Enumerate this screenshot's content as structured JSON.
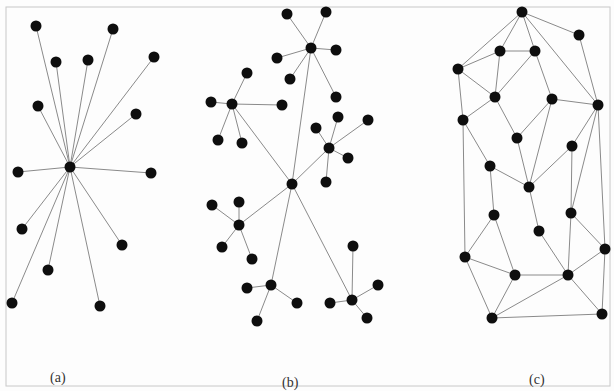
{
  "panels": [
    {
      "id": "a",
      "label": "(a)",
      "type": "star",
      "nodes": [
        {
          "id": "c",
          "x": 70,
          "y": 167
        },
        {
          "id": "n1",
          "x": 36,
          "y": 26
        },
        {
          "id": "n2",
          "x": 113,
          "y": 29
        },
        {
          "id": "n3",
          "x": 56,
          "y": 62
        },
        {
          "id": "n4",
          "x": 88,
          "y": 60
        },
        {
          "id": "n5",
          "x": 154,
          "y": 57
        },
        {
          "id": "n6",
          "x": 38,
          "y": 106
        },
        {
          "id": "n7",
          "x": 136,
          "y": 114
        },
        {
          "id": "n8",
          "x": 18,
          "y": 172
        },
        {
          "id": "n9",
          "x": 151,
          "y": 173
        },
        {
          "id": "n10",
          "x": 22,
          "y": 229
        },
        {
          "id": "n11",
          "x": 122,
          "y": 245
        },
        {
          "id": "n12",
          "x": 48,
          "y": 270
        },
        {
          "id": "n13",
          "x": 12,
          "y": 303
        },
        {
          "id": "n14",
          "x": 100,
          "y": 306
        }
      ],
      "edges": [
        [
          "c",
          "n1"
        ],
        [
          "c",
          "n2"
        ],
        [
          "c",
          "n3"
        ],
        [
          "c",
          "n4"
        ],
        [
          "c",
          "n5"
        ],
        [
          "c",
          "n6"
        ],
        [
          "c",
          "n7"
        ],
        [
          "c",
          "n8"
        ],
        [
          "c",
          "n9"
        ],
        [
          "c",
          "n10"
        ],
        [
          "c",
          "n11"
        ],
        [
          "c",
          "n12"
        ],
        [
          "c",
          "n13"
        ],
        [
          "c",
          "n14"
        ]
      ]
    },
    {
      "id": "b",
      "label": "(b)",
      "type": "hierarchical",
      "nodes": [
        {
          "id": "c",
          "x": 292,
          "y": 184
        },
        {
          "id": "h1",
          "x": 311,
          "y": 48
        },
        {
          "id": "h1a",
          "x": 287,
          "y": 14
        },
        {
          "id": "h1b",
          "x": 326,
          "y": 12
        },
        {
          "id": "h1c",
          "x": 277,
          "y": 58
        },
        {
          "id": "h1d",
          "x": 336,
          "y": 50
        },
        {
          "id": "h1e",
          "x": 290,
          "y": 79
        },
        {
          "id": "h1f",
          "x": 336,
          "y": 97
        },
        {
          "id": "h2",
          "x": 232,
          "y": 104
        },
        {
          "id": "h2a",
          "x": 211,
          "y": 102
        },
        {
          "id": "h2b",
          "x": 247,
          "y": 73
        },
        {
          "id": "h2c",
          "x": 282,
          "y": 105
        },
        {
          "id": "h2d",
          "x": 218,
          "y": 140
        },
        {
          "id": "h2e",
          "x": 242,
          "y": 143
        },
        {
          "id": "h3",
          "x": 329,
          "y": 148
        },
        {
          "id": "h3a",
          "x": 316,
          "y": 128
        },
        {
          "id": "h3b",
          "x": 338,
          "y": 117
        },
        {
          "id": "h3c",
          "x": 368,
          "y": 120
        },
        {
          "id": "h3d",
          "x": 348,
          "y": 158
        },
        {
          "id": "h3e",
          "x": 326,
          "y": 182
        },
        {
          "id": "h4",
          "x": 239,
          "y": 225
        },
        {
          "id": "h4a",
          "x": 212,
          "y": 205
        },
        {
          "id": "h4b",
          "x": 239,
          "y": 202
        },
        {
          "id": "h4c",
          "x": 222,
          "y": 247
        },
        {
          "id": "h4d",
          "x": 252,
          "y": 259
        },
        {
          "id": "h5",
          "x": 271,
          "y": 285
        },
        {
          "id": "h5a",
          "x": 247,
          "y": 288
        },
        {
          "id": "h5b",
          "x": 297,
          "y": 303
        },
        {
          "id": "h5c",
          "x": 257,
          "y": 321
        },
        {
          "id": "h6",
          "x": 352,
          "y": 300
        },
        {
          "id": "h6a",
          "x": 353,
          "y": 246
        },
        {
          "id": "h6b",
          "x": 378,
          "y": 285
        },
        {
          "id": "h6c",
          "x": 330,
          "y": 303
        },
        {
          "id": "h6d",
          "x": 367,
          "y": 318
        }
      ],
      "edges": [
        [
          "c",
          "h1"
        ],
        [
          "c",
          "h2"
        ],
        [
          "c",
          "h3"
        ],
        [
          "c",
          "h4"
        ],
        [
          "c",
          "h5"
        ],
        [
          "c",
          "h6"
        ],
        [
          "h1",
          "h1a"
        ],
        [
          "h1",
          "h1b"
        ],
        [
          "h1",
          "h1c"
        ],
        [
          "h1",
          "h1d"
        ],
        [
          "h1",
          "h1e"
        ],
        [
          "h1",
          "h1f"
        ],
        [
          "h2",
          "h2a"
        ],
        [
          "h2",
          "h2b"
        ],
        [
          "h2",
          "h2c"
        ],
        [
          "h2",
          "h2d"
        ],
        [
          "h2",
          "h2e"
        ],
        [
          "h3",
          "h3a"
        ],
        [
          "h3",
          "h3b"
        ],
        [
          "h3",
          "h3c"
        ],
        [
          "h3",
          "h3d"
        ],
        [
          "h3",
          "h3e"
        ],
        [
          "h4",
          "h4a"
        ],
        [
          "h4",
          "h4b"
        ],
        [
          "h4",
          "h4c"
        ],
        [
          "h4",
          "h4d"
        ],
        [
          "h5",
          "h5a"
        ],
        [
          "h5",
          "h5b"
        ],
        [
          "h5",
          "h5c"
        ],
        [
          "h6",
          "h6a"
        ],
        [
          "h6",
          "h6b"
        ],
        [
          "h6",
          "h6c"
        ],
        [
          "h6",
          "h6d"
        ]
      ]
    },
    {
      "id": "c",
      "label": "(c)",
      "type": "mesh",
      "nodes": [
        {
          "id": "A",
          "x": 522,
          "y": 12
        },
        {
          "id": "B",
          "x": 579,
          "y": 35
        },
        {
          "id": "C",
          "x": 500,
          "y": 51
        },
        {
          "id": "D",
          "x": 535,
          "y": 51
        },
        {
          "id": "E",
          "x": 458,
          "y": 69
        },
        {
          "id": "F",
          "x": 495,
          "y": 97
        },
        {
          "id": "G",
          "x": 552,
          "y": 99
        },
        {
          "id": "H",
          "x": 598,
          "y": 105
        },
        {
          "id": "I",
          "x": 463,
          "y": 120
        },
        {
          "id": "J",
          "x": 517,
          "y": 138
        },
        {
          "id": "K",
          "x": 572,
          "y": 146
        },
        {
          "id": "L",
          "x": 490,
          "y": 166
        },
        {
          "id": "M",
          "x": 529,
          "y": 187
        },
        {
          "id": "N",
          "x": 494,
          "y": 215
        },
        {
          "id": "O",
          "x": 571,
          "y": 213
        },
        {
          "id": "P",
          "x": 539,
          "y": 231
        },
        {
          "id": "Q",
          "x": 465,
          "y": 257
        },
        {
          "id": "R",
          "x": 605,
          "y": 249
        },
        {
          "id": "S",
          "x": 515,
          "y": 275
        },
        {
          "id": "T",
          "x": 568,
          "y": 275
        },
        {
          "id": "U",
          "x": 492,
          "y": 318
        },
        {
          "id": "V",
          "x": 602,
          "y": 314
        }
      ],
      "edges": [
        [
          "A",
          "B"
        ],
        [
          "A",
          "C"
        ],
        [
          "A",
          "D"
        ],
        [
          "A",
          "E"
        ],
        [
          "A",
          "H"
        ],
        [
          "B",
          "H"
        ],
        [
          "C",
          "D"
        ],
        [
          "C",
          "E"
        ],
        [
          "C",
          "F"
        ],
        [
          "D",
          "F"
        ],
        [
          "D",
          "G"
        ],
        [
          "E",
          "F"
        ],
        [
          "E",
          "I"
        ],
        [
          "F",
          "I"
        ],
        [
          "F",
          "J"
        ],
        [
          "G",
          "H"
        ],
        [
          "G",
          "J"
        ],
        [
          "G",
          "M"
        ],
        [
          "I",
          "L"
        ],
        [
          "I",
          "Q"
        ],
        [
          "J",
          "M"
        ],
        [
          "H",
          "K"
        ],
        [
          "H",
          "O"
        ],
        [
          "H",
          "R"
        ],
        [
          "K",
          "M"
        ],
        [
          "K",
          "O"
        ],
        [
          "L",
          "M"
        ],
        [
          "L",
          "N"
        ],
        [
          "M",
          "P"
        ],
        [
          "N",
          "Q"
        ],
        [
          "N",
          "S"
        ],
        [
          "P",
          "T"
        ],
        [
          "O",
          "T"
        ],
        [
          "O",
          "R"
        ],
        [
          "Q",
          "S"
        ],
        [
          "Q",
          "U"
        ],
        [
          "S",
          "T"
        ],
        [
          "S",
          "U"
        ],
        [
          "T",
          "U"
        ],
        [
          "T",
          "R"
        ],
        [
          "T",
          "V"
        ],
        [
          "U",
          "V"
        ],
        [
          "R",
          "V"
        ]
      ]
    }
  ]
}
